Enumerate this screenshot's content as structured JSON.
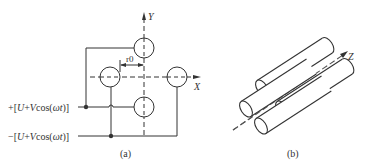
{
  "diagram": {
    "panel_a": {
      "caption": "(a)",
      "axis_y_label": "Y",
      "axis_x_label": "X",
      "radius_label": "r0",
      "top_voltage_label": "+[U+Vcos(ωt)]",
      "bottom_voltage_label": "−[U+Vcos(ωt)]",
      "electrodes": [
        "top",
        "left",
        "right",
        "bottom"
      ]
    },
    "panel_b": {
      "caption": "(b)",
      "axis_z_label": "Z",
      "rods": 4
    },
    "colors": {
      "stroke": "#333333",
      "background": "#ffffff"
    }
  }
}
